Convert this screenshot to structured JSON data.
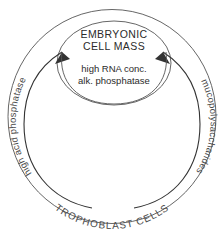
{
  "diagram": {
    "title_semantic": "blastocyst-embryonic-cell-mass-diagram",
    "outer_region": {
      "label": "TROPHOBLAST CELLS"
    },
    "inner_region": {
      "title_line1": "EMBRYONIC",
      "title_line2": "CELL MASS",
      "detail_line1": "high RNA conc.",
      "detail_line2": "alk. phosphatase"
    },
    "annotations": {
      "left_curved_label": "high acid phosphatase",
      "right_curved_label": "mucopolysaccharides"
    },
    "arrows": [
      {
        "name": "left-arrow-to-cell-mass",
        "direction": "counterclockwise-up"
      },
      {
        "name": "right-arrow-to-cell-mass",
        "direction": "clockwise-up"
      }
    ],
    "colors": {
      "background": "#ffffff",
      "line": "#555555",
      "arrow": "#333333",
      "text": "#2b2b2b",
      "label_text": "#4a4a4a"
    }
  }
}
